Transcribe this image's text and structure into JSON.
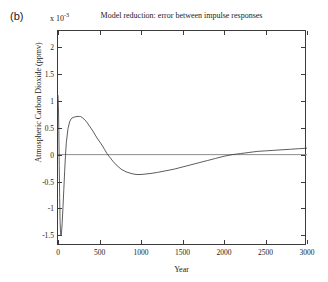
{
  "panel": {
    "label": "(b)"
  },
  "axes": {
    "exponent_prefix": "x 10",
    "exponent_power": "-3",
    "x_title": "Year",
    "y_title": "Atmospheric Carbon Dioxide (ppmv)"
  },
  "chart_data": {
    "type": "line",
    "title": "Model reduction: error between impulse responses",
    "xlabel": "Year",
    "ylabel": "Atmospheric Carbon Dioxide (ppmv)",
    "y_scale_note": "x 10^-3",
    "xlim": [
      0,
      3000
    ],
    "ylim": [
      -0.0017,
      0.0023
    ],
    "grid": false,
    "legend": null,
    "xticks": [
      0,
      500,
      1000,
      1500,
      2000,
      2500,
      3000
    ],
    "xtick_labels": [
      "0",
      "500",
      "1000",
      "1500",
      "2000",
      "2500",
      "3000"
    ],
    "yticks": [
      0.002,
      0.0015,
      0.001,
      0.0005,
      0,
      -0.0005,
      -0.001,
      -0.0015
    ],
    "ytick_labels": [
      "2",
      "1.5",
      "1",
      "0.5",
      "0",
      "-0.5",
      "-1",
      "-1.5"
    ],
    "zero_line": true,
    "series": [
      {
        "name": "impulse response error",
        "color": "#333333",
        "x": [
          0,
          5,
          10,
          15,
          20,
          25,
          30,
          35,
          40,
          45,
          50,
          60,
          70,
          80,
          90,
          100,
          120,
          140,
          160,
          180,
          200,
          230,
          260,
          270,
          300,
          340,
          380,
          420,
          470,
          520,
          560,
          590,
          620,
          660,
          700,
          760,
          820,
          880,
          940,
          1000,
          1060,
          1120,
          1200,
          1300,
          1400,
          1500,
          1600,
          1700,
          1800,
          1900,
          2000,
          2100,
          2150,
          2200,
          2300,
          2400,
          2500,
          2600,
          2700,
          2800,
          2900,
          3000
        ],
        "y": [
          0.0011,
          0.0009,
          0.00045,
          -0.0002,
          -0.0008,
          -0.00125,
          -0.00145,
          -0.0015,
          -0.00148,
          -0.0014,
          -0.00128,
          -0.00098,
          -0.00065,
          -0.00032,
          -2e-05,
          0.00022,
          0.00048,
          0.00061,
          0.00067,
          0.00069,
          0.0007,
          0.00071,
          0.00071,
          0.00071,
          0.00068,
          0.00062,
          0.00053,
          0.00044,
          0.00031,
          0.0002,
          0.0001,
          2e-05,
          -4e-05,
          -0.00012,
          -0.00019,
          -0.00027,
          -0.00032,
          -0.00035,
          -0.00037,
          -0.00037,
          -0.00036,
          -0.00035,
          -0.00033,
          -0.0003,
          -0.00027,
          -0.00023,
          -0.00019,
          -0.00015,
          -0.00011,
          -7e-05,
          -3e-05,
          0.0,
          1e-05,
          2e-05,
          4e-05,
          6e-05,
          7e-05,
          8e-05,
          9e-05,
          0.0001,
          0.00011,
          0.00012
        ]
      }
    ],
    "annotations": [
      {
        "text": "initial transient spike",
        "x": 25,
        "y": -0.0015
      },
      {
        "text": "positive peak",
        "x": 265,
        "y": 0.00071
      },
      {
        "text": "negative trough",
        "x": 1000,
        "y": -0.00037
      }
    ]
  }
}
